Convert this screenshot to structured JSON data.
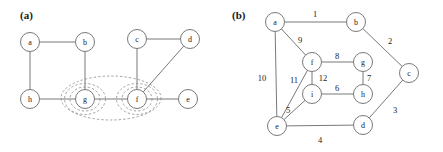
{
  "figure": {
    "width": 443,
    "height": 152,
    "background": "#ffffff",
    "stroke_color": "#6a6a6a",
    "text_color": "#1a1a1a",
    "dash_color": "#8a8a8a"
  },
  "panels": {
    "a": {
      "label": "(a)",
      "label_pos": {
        "x": 20,
        "y": 9
      },
      "node_radius": 9.5,
      "nodes": [
        {
          "id": "a",
          "label": "a",
          "x": 30,
          "y": 42
        },
        {
          "id": "b",
          "label": "b",
          "x": 85,
          "y": 42
        },
        {
          "id": "c",
          "label": "c",
          "x": 137,
          "y": 39
        },
        {
          "id": "d",
          "label": "d",
          "x": 190,
          "y": 39
        },
        {
          "id": "h",
          "label": "h",
          "x": 30,
          "y": 99
        },
        {
          "id": "g",
          "label": "g",
          "x": 85,
          "y": 99
        },
        {
          "id": "f",
          "label": "f",
          "x": 137,
          "y": 99
        },
        {
          "id": "e",
          "label": "e",
          "x": 188,
          "y": 99
        }
      ],
      "edges": [
        {
          "from": "a",
          "to": "b"
        },
        {
          "from": "a",
          "to": "h"
        },
        {
          "from": "b",
          "to": "g"
        },
        {
          "from": "h",
          "to": "g"
        },
        {
          "from": "g",
          "to": "f"
        },
        {
          "from": "c",
          "to": "d"
        },
        {
          "from": "c",
          "to": "f"
        },
        {
          "from": "d",
          "to": "f"
        },
        {
          "from": "f",
          "to": "e"
        }
      ],
      "clusters": [
        {
          "name": "cluster-g-inner",
          "cx": 85,
          "cy": 99,
          "rx": 15,
          "ry": 12
        },
        {
          "name": "cluster-g-outer",
          "cx": 85,
          "cy": 99,
          "rx": 20.5,
          "ry": 15.5
        },
        {
          "name": "cluster-f-inner",
          "cx": 137,
          "cy": 99,
          "rx": 15,
          "ry": 12
        },
        {
          "name": "cluster-f-outer",
          "cx": 137,
          "cy": 99,
          "rx": 20.5,
          "ry": 15.5
        },
        {
          "name": "cluster-gf-union",
          "cx": 111,
          "cy": 98,
          "rx": 50,
          "ry": 22
        }
      ]
    },
    "b": {
      "label": "(b)",
      "label_pos": {
        "x": 232,
        "y": 9
      },
      "node_radius": 9.5,
      "nodes": [
        {
          "id": "a",
          "label": "a",
          "x": 275,
          "y": 22
        },
        {
          "id": "b",
          "label": "b",
          "x": 356,
          "y": 22
        },
        {
          "id": "c",
          "label": "c",
          "x": 409,
          "y": 73
        },
        {
          "id": "d",
          "label": "d",
          "x": 363,
          "y": 125
        },
        {
          "id": "e",
          "label": "e",
          "x": 277,
          "y": 126
        },
        {
          "id": "f",
          "label": "f",
          "x": 312,
          "y": 62
        },
        {
          "id": "g",
          "label": "g",
          "x": 363,
          "y": 62
        },
        {
          "id": "h",
          "label": "h",
          "x": 363,
          "y": 94
        },
        {
          "id": "i",
          "label": "i",
          "x": 312,
          "y": 94
        }
      ],
      "edges": [
        {
          "from": "a",
          "to": "b",
          "weight": "1",
          "label_x": 315,
          "label_y": 14
        },
        {
          "from": "b",
          "to": "c",
          "weight": "2",
          "label_x": 390,
          "label_y": 41
        },
        {
          "from": "c",
          "to": "d",
          "weight": "3",
          "label_x": 395,
          "label_y": 110
        },
        {
          "from": "d",
          "to": "e",
          "weight": "4",
          "label_x": 320,
          "label_y": 140
        },
        {
          "from": "e",
          "to": "i",
          "weight": "5",
          "label_x": 288,
          "label_y": 110
        },
        {
          "from": "i",
          "to": "h",
          "weight": "6",
          "label_x": 337,
          "label_y": 88
        },
        {
          "from": "g",
          "to": "h",
          "weight": "7",
          "label_x": 369,
          "label_y": 78
        },
        {
          "from": "f",
          "to": "g",
          "weight": "8",
          "label_x": 337,
          "label_y": 56
        },
        {
          "from": "a",
          "to": "f",
          "weight": "9",
          "label_x": 300,
          "label_y": 40
        },
        {
          "from": "a",
          "to": "e",
          "weight": "10",
          "label_x": 262,
          "label_y": 78
        },
        {
          "from": "e",
          "to": "f",
          "weight": "11",
          "label_x": 294,
          "label_y": 80
        },
        {
          "from": "f",
          "to": "i",
          "weight": "12",
          "label_x": 323,
          "label_y": 78
        }
      ]
    }
  }
}
